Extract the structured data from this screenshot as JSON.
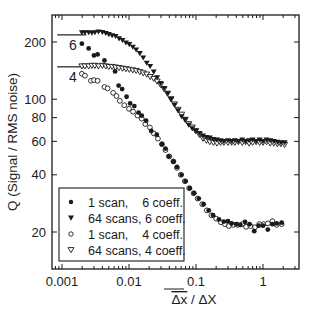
{
  "chart_data": {
    "type": "scatter",
    "title": "",
    "xlabel": "Δx̄ / ΔX",
    "xlabel_parts": {
      "overlined": "Δx",
      "rest": " / ΔX"
    },
    "ylabel": "Q (Signal / RMS noise)",
    "xscale": "log",
    "yscale": "log",
    "xlim": [
      0.0007,
      3.3
    ],
    "ylim": [
      12.8,
      277
    ],
    "x_ticks": [
      {
        "value": 0.001,
        "label": "0.001"
      },
      {
        "value": 0.01,
        "label": "0.01"
      },
      {
        "value": 0.1,
        "label": "0.1"
      },
      {
        "value": 1,
        "label": "1"
      }
    ],
    "y_ticks": [
      {
        "value": 20,
        "label": "20"
      },
      {
        "value": 40,
        "label": "40"
      },
      {
        "value": 60,
        "label": "60"
      },
      {
        "value": 80,
        "label": "80"
      },
      {
        "value": 100,
        "label": "100"
      },
      {
        "value": 200,
        "label": "200"
      }
    ],
    "grid": false,
    "legend_position": "lower left",
    "reference_lines": [
      {
        "label": "6",
        "y": 218,
        "x_range": [
          0.00085,
          0.0023
        ]
      },
      {
        "label": "4",
        "y": 148,
        "x_range": [
          0.00085,
          0.0023
        ]
      }
    ],
    "series": [
      {
        "name": "1 scan,    6 coeff.",
        "marker": "filled-circle",
        "points": [
          [
            0.00198,
            196
          ],
          [
            0.0025,
            185
          ],
          [
            0.003,
            170
          ],
          [
            0.0034,
            172
          ],
          [
            0.0043,
            160
          ],
          [
            0.0062,
            140
          ],
          [
            0.007,
            118
          ],
          [
            0.0079,
            113
          ],
          [
            0.0092,
            103
          ],
          [
            0.0104,
            95
          ],
          [
            0.012,
            92
          ],
          [
            0.0139,
            85
          ],
          [
            0.0155,
            82
          ],
          [
            0.018,
            77
          ],
          [
            0.0215,
            68
          ],
          [
            0.026,
            65
          ],
          [
            0.031,
            58
          ],
          [
            0.035,
            55
          ],
          [
            0.039,
            50
          ],
          [
            0.046,
            47
          ],
          [
            0.052,
            44
          ],
          [
            0.061,
            40
          ],
          [
            0.07,
            37
          ],
          [
            0.081,
            34
          ],
          [
            0.094,
            32
          ],
          [
            0.11,
            30
          ],
          [
            0.13,
            28
          ],
          [
            0.155,
            26
          ],
          [
            0.18,
            24.5
          ],
          [
            0.22,
            23.3
          ],
          [
            0.26,
            22.7
          ],
          [
            0.3,
            22.8
          ],
          [
            0.34,
            22.2
          ],
          [
            0.4,
            22.0
          ],
          [
            0.46,
            21.8
          ],
          [
            0.54,
            22.6
          ],
          [
            0.63,
            22.0
          ],
          [
            0.74,
            20.2
          ],
          [
            0.86,
            21.6
          ],
          [
            1.0,
            21.6
          ],
          [
            1.18,
            20.6
          ],
          [
            1.38,
            22.0
          ],
          [
            1.6,
            22.2
          ],
          [
            1.9,
            22.4
          ]
        ]
      },
      {
        "name": "64 scans, 6 coeff.",
        "marker": "filled-triangle-down",
        "points": [
          [
            0.00198,
            224
          ],
          [
            0.0022,
            224
          ],
          [
            0.0025,
            224
          ],
          [
            0.0028,
            223
          ],
          [
            0.0031,
            224
          ],
          [
            0.0035,
            226
          ],
          [
            0.004,
            225
          ],
          [
            0.0045,
            222
          ],
          [
            0.005,
            219
          ],
          [
            0.0056,
            216
          ],
          [
            0.0063,
            214
          ],
          [
            0.0071,
            208
          ],
          [
            0.008,
            204
          ],
          [
            0.009,
            198
          ],
          [
            0.0101,
            194
          ],
          [
            0.0114,
            188
          ],
          [
            0.0128,
            182
          ],
          [
            0.0145,
            174
          ],
          [
            0.0163,
            165
          ],
          [
            0.0184,
            155
          ],
          [
            0.0207,
            149
          ],
          [
            0.0234,
            139
          ],
          [
            0.0263,
            130
          ],
          [
            0.0296,
            121
          ],
          [
            0.0334,
            114
          ],
          [
            0.0376,
            107
          ],
          [
            0.0424,
            100
          ],
          [
            0.0478,
            93
          ],
          [
            0.054,
            87
          ],
          [
            0.061,
            81
          ],
          [
            0.069,
            78
          ],
          [
            0.078,
            73
          ],
          [
            0.088,
            70
          ],
          [
            0.099,
            68
          ],
          [
            0.112,
            66
          ],
          [
            0.127,
            64
          ],
          [
            0.143,
            63
          ],
          [
            0.161,
            62.5
          ],
          [
            0.182,
            61.5
          ],
          [
            0.205,
            61
          ],
          [
            0.232,
            60.5
          ],
          [
            0.26,
            60
          ],
          [
            0.3,
            60.5
          ],
          [
            0.34,
            60
          ],
          [
            0.38,
            60.5
          ],
          [
            0.43,
            60
          ],
          [
            0.49,
            61
          ],
          [
            0.55,
            60
          ],
          [
            0.62,
            60.5
          ],
          [
            0.7,
            61
          ],
          [
            0.79,
            60
          ],
          [
            0.89,
            61
          ],
          [
            1.0,
            60
          ],
          [
            1.13,
            61
          ],
          [
            1.28,
            60.5
          ],
          [
            1.45,
            60
          ],
          [
            1.64,
            59.5
          ],
          [
            1.85,
            59
          ],
          [
            2.1,
            59
          ]
        ]
      },
      {
        "name": "1 scan,    4 coeff.",
        "marker": "open-circle",
        "points": [
          [
            0.00198,
            136
          ],
          [
            0.0022,
            133
          ],
          [
            0.0027,
            125
          ],
          [
            0.003,
            126
          ],
          [
            0.0034,
            125
          ],
          [
            0.0043,
            116
          ],
          [
            0.0048,
            114
          ],
          [
            0.0058,
            108
          ],
          [
            0.0065,
            104
          ],
          [
            0.0073,
            98
          ],
          [
            0.0085,
            93
          ],
          [
            0.01,
            89
          ],
          [
            0.0115,
            86
          ],
          [
            0.0134,
            82
          ],
          [
            0.0155,
            79
          ],
          [
            0.0175,
            74
          ],
          [
            0.0205,
            71
          ],
          [
            0.0235,
            66
          ],
          [
            0.027,
            62
          ],
          [
            0.031,
            58
          ],
          [
            0.035,
            54
          ],
          [
            0.04,
            50
          ],
          [
            0.046,
            47
          ],
          [
            0.052,
            43.5
          ],
          [
            0.059,
            40
          ],
          [
            0.068,
            37
          ],
          [
            0.079,
            34
          ],
          [
            0.092,
            32
          ],
          [
            0.106,
            30
          ],
          [
            0.124,
            28
          ],
          [
            0.145,
            26
          ],
          [
            0.17,
            24.5
          ],
          [
            0.2,
            23.5
          ],
          [
            0.235,
            22.5
          ],
          [
            0.27,
            22
          ],
          [
            0.31,
            21.5
          ],
          [
            0.36,
            21.8
          ],
          [
            0.42,
            21.8
          ],
          [
            0.49,
            22
          ],
          [
            0.56,
            21.3
          ],
          [
            0.65,
            21.5
          ],
          [
            0.76,
            21.2
          ],
          [
            0.88,
            22
          ],
          [
            1.02,
            22
          ],
          [
            1.18,
            22.2
          ],
          [
            1.38,
            22.8
          ],
          [
            1.6,
            21.8
          ],
          [
            1.9,
            22
          ]
        ]
      },
      {
        "name": "64 scans, 4 coeff.",
        "marker": "open-triangle-down",
        "points": [
          [
            0.00198,
            149
          ],
          [
            0.0022,
            149
          ],
          [
            0.0025,
            149
          ],
          [
            0.0028,
            150
          ],
          [
            0.0031,
            150
          ],
          [
            0.0035,
            149
          ],
          [
            0.004,
            150
          ],
          [
            0.0045,
            149
          ],
          [
            0.005,
            148
          ],
          [
            0.0056,
            148
          ],
          [
            0.0063,
            147
          ],
          [
            0.0071,
            146
          ],
          [
            0.008,
            145
          ],
          [
            0.009,
            144
          ],
          [
            0.0101,
            143
          ],
          [
            0.0114,
            142
          ],
          [
            0.0128,
            141
          ],
          [
            0.0145,
            139
          ],
          [
            0.0163,
            137
          ],
          [
            0.0184,
            135
          ],
          [
            0.0207,
            131
          ],
          [
            0.0234,
            128
          ],
          [
            0.0263,
            124
          ],
          [
            0.0296,
            119
          ],
          [
            0.0334,
            113
          ],
          [
            0.0376,
            107
          ],
          [
            0.0424,
            100
          ],
          [
            0.0478,
            94
          ],
          [
            0.054,
            88
          ],
          [
            0.061,
            83
          ],
          [
            0.069,
            78
          ],
          [
            0.078,
            74
          ],
          [
            0.088,
            71
          ],
          [
            0.099,
            68
          ],
          [
            0.112,
            65
          ],
          [
            0.127,
            62
          ],
          [
            0.143,
            60.5
          ],
          [
            0.161,
            59.5
          ],
          [
            0.182,
            59
          ],
          [
            0.205,
            58.5
          ],
          [
            0.232,
            59
          ],
          [
            0.26,
            59
          ],
          [
            0.3,
            59
          ],
          [
            0.34,
            59
          ],
          [
            0.38,
            59
          ],
          [
            0.43,
            59.5
          ],
          [
            0.49,
            59
          ],
          [
            0.55,
            59.5
          ],
          [
            0.62,
            58.5
          ],
          [
            0.7,
            59
          ],
          [
            0.79,
            59.5
          ],
          [
            0.89,
            59
          ],
          [
            1.0,
            59
          ],
          [
            1.13,
            59.5
          ],
          [
            1.28,
            58.5
          ],
          [
            1.45,
            58.5
          ],
          [
            1.64,
            58
          ],
          [
            1.85,
            58
          ],
          [
            2.1,
            57.5
          ]
        ]
      }
    ]
  },
  "legend": {
    "items": [
      {
        "marker": "filled-circle",
        "label": "1 scan,    6 coeff."
      },
      {
        "marker": "filled-triangle-down",
        "label": "64 scans, 6 coeff."
      },
      {
        "marker": "open-circle",
        "label": "1 scan,    4 coeff."
      },
      {
        "marker": "open-triangle-down",
        "label": "64 scans, 4 coeff."
      }
    ]
  },
  "colors": {
    "ink": "#1a1a1a",
    "background": "#ffffff"
  }
}
